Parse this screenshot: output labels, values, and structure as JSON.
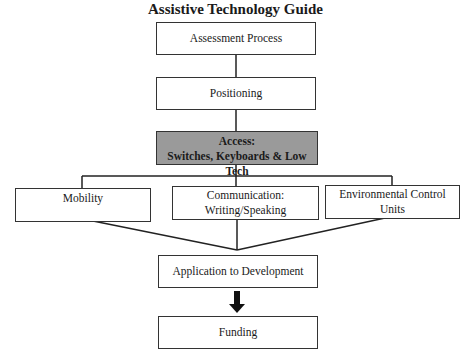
{
  "title": "Assistive Technology Guide",
  "nodes": {
    "assessment": {
      "label": "Assessment Process"
    },
    "positioning": {
      "label": "Positioning"
    },
    "access": {
      "line1": "Access:",
      "line2": "Switches, Keyboards & Low Tech",
      "fill": "#9a9a9a"
    },
    "mobility": {
      "label": "Mobility"
    },
    "communication": {
      "line1": "Communication:",
      "line2": "Writing/Speaking"
    },
    "environmental": {
      "line1": "Environmental Control",
      "line2": "Units"
    },
    "application": {
      "label": "Application to Development"
    },
    "funding": {
      "label": "Funding"
    }
  },
  "edges": [
    {
      "from": "assessment",
      "to": "positioning",
      "style": "line"
    },
    {
      "from": "positioning",
      "to": "access",
      "style": "line"
    },
    {
      "from": "access",
      "to": "mobility",
      "style": "elbow"
    },
    {
      "from": "access",
      "to": "communication",
      "style": "elbow"
    },
    {
      "from": "access",
      "to": "environmental",
      "style": "elbow"
    },
    {
      "from": "mobility",
      "to": "application",
      "style": "converge"
    },
    {
      "from": "communication",
      "to": "application",
      "style": "converge"
    },
    {
      "from": "environmental",
      "to": "application",
      "style": "converge"
    },
    {
      "from": "application",
      "to": "funding",
      "style": "thick-arrow"
    }
  ]
}
